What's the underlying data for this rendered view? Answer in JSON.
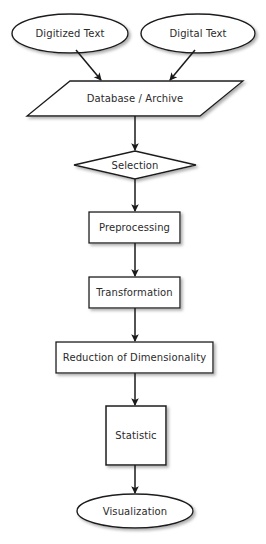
{
  "diagram": {
    "background_color": "#ffffff",
    "stroke_color": "#1a1a1a",
    "text_color": "#2b2b2b",
    "fill_color": "#ffffff",
    "shadow_color": "#b4b4b4"
  },
  "nodes": [
    {
      "id": "digitized-text",
      "label": "Digitized Text",
      "shape": "ellipse",
      "x": 12,
      "y": 14,
      "w": 116,
      "h": 39
    },
    {
      "id": "digital-text",
      "label": "Digital Text",
      "shape": "ellipse",
      "x": 141,
      "y": 14,
      "w": 114,
      "h": 39
    },
    {
      "id": "database-archive",
      "label": "Database / Archive",
      "shape": "parallelogram",
      "x": 27,
      "y": 81,
      "w": 216,
      "h": 35
    },
    {
      "id": "selection",
      "label": "Selection",
      "shape": "diamond",
      "x": 74,
      "y": 151,
      "w": 122,
      "h": 28
    },
    {
      "id": "preprocessing",
      "label": "Preprocessing",
      "shape": "rectangle",
      "x": 89,
      "y": 212,
      "w": 91,
      "h": 31
    },
    {
      "id": "transformation",
      "label": "Transformation",
      "shape": "rectangle",
      "x": 89,
      "y": 277,
      "w": 91,
      "h": 31
    },
    {
      "id": "reduction-of-dimensionality",
      "label": "Reduction of Dimensionality",
      "shape": "rectangle",
      "x": 56,
      "y": 342,
      "w": 157,
      "h": 31
    },
    {
      "id": "statistic",
      "label": "Statistic",
      "shape": "rectangle",
      "x": 106,
      "y": 406,
      "w": 60,
      "h": 59
    },
    {
      "id": "visualization",
      "label": "Visualization",
      "shape": "ellipse",
      "x": 77,
      "y": 494,
      "w": 116,
      "h": 34
    }
  ],
  "edges": [
    {
      "id": "digitized-text-to-database",
      "from": "digitized-text",
      "to": "database-archive",
      "style": "diagonal-arrow"
    },
    {
      "id": "digital-text-to-database",
      "from": "digital-text",
      "to": "database-archive",
      "style": "diagonal-arrow"
    },
    {
      "id": "database-to-selection",
      "from": "database-archive",
      "to": "selection",
      "style": "vertical-arrow"
    },
    {
      "id": "selection-to-preprocessing",
      "from": "selection",
      "to": "preprocessing",
      "style": "vertical-arrow"
    },
    {
      "id": "preprocessing-to-transformation",
      "from": "preprocessing",
      "to": "transformation",
      "style": "vertical-arrow"
    },
    {
      "id": "transformation-to-reduction",
      "from": "transformation",
      "to": "reduction-of-dimensionality",
      "style": "vertical-arrow"
    },
    {
      "id": "reduction-to-statistic",
      "from": "reduction-of-dimensionality",
      "to": "statistic",
      "style": "vertical-arrow"
    },
    {
      "id": "statistic-to-visualization",
      "from": "statistic",
      "to": "visualization",
      "style": "vertical-arrow"
    }
  ]
}
